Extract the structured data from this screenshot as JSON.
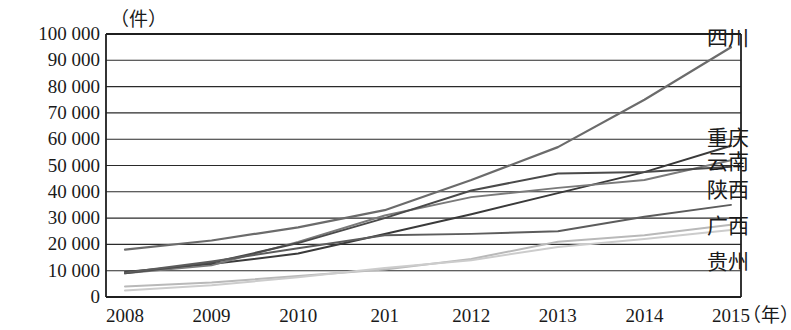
{
  "chart_data": {
    "type": "line",
    "title": "",
    "subtitle": "",
    "xlabel": "年",
    "ylabel": "件",
    "unit_top": "（件）",
    "unit_right": "（年）",
    "grid": true,
    "legend_position": "right-inline",
    "x": [
      "2008",
      "2009",
      "2010",
      "201",
      "2012",
      "2013",
      "2014",
      "2015"
    ],
    "x_tick_labels": [
      "2008",
      "2009",
      "2010",
      "201",
      "2012",
      "2013",
      "2014",
      "2015"
    ],
    "y_tick_labels": [
      "0",
      "10 000",
      "20 000",
      "30 000",
      "40 000",
      "50 000",
      "60 000",
      "70 000",
      "80 000",
      "90 000",
      "100 000"
    ],
    "y_tick_values": [
      0,
      10000,
      20000,
      30000,
      40000,
      50000,
      60000,
      70000,
      80000,
      90000,
      100000
    ],
    "ylim": [
      0,
      100000
    ],
    "series": [
      {
        "name": "四川",
        "color": "#6b6b6b",
        "width": 2.2,
        "values": [
          18000,
          21500,
          26500,
          33000,
          44500,
          57000,
          75000,
          95000
        ]
      },
      {
        "name": "重庆",
        "color": "#3a3a3a",
        "width": 2.0,
        "values": [
          9500,
          12500,
          16500,
          24000,
          31500,
          39500,
          47500,
          57500
        ]
      },
      {
        "name": "云南",
        "color": "#7a7a7a",
        "width": 1.9,
        "values": [
          9000,
          12000,
          21000,
          31000,
          38000,
          41500,
          44500,
          52000
        ]
      },
      {
        "name": "陕西",
        "color": "#4a4a4a",
        "width": 2.0,
        "values": [
          9000,
          13000,
          20500,
          30000,
          40500,
          47000,
          47500,
          49500
        ]
      },
      {
        "name": "广西",
        "color": "#5c5c5c",
        "width": 1.9,
        "values": [
          9200,
          13500,
          18500,
          23500,
          24000,
          25000,
          30500,
          35000
        ]
      },
      {
        "name": "贵州",
        "color": "#b9b9b9",
        "width": 2.0,
        "values": [
          4000,
          5500,
          8000,
          10500,
          14500,
          21000,
          23500,
          27500
        ]
      },
      {
        "name": "贵州-low",
        "color": "#cccccc",
        "width": 2.0,
        "values": [
          2500,
          4500,
          7500,
          11000,
          14000,
          19000,
          22000,
          25500
        ]
      }
    ],
    "series_labels": [
      {
        "name": "四川",
        "top": 28
      },
      {
        "name": "重庆",
        "top": 128
      },
      {
        "name": "云南",
        "top": 152
      },
      {
        "name": "陕西",
        "top": 180
      },
      {
        "name": "广西",
        "top": 216
      },
      {
        "name": "贵州",
        "top": 252
      }
    ]
  }
}
